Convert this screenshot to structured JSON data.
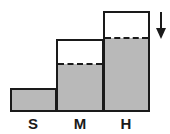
{
  "diagram": {
    "colors": {
      "fill": "#b9b9b9",
      "stroke": "#1a1a1a",
      "background": "#ffffff"
    },
    "bars": [
      {
        "label": "S",
        "fill_level": "full"
      },
      {
        "label": "M",
        "fill_level": "partial"
      },
      {
        "label": "H",
        "fill_level": "partial"
      }
    ],
    "arrow": {
      "direction": "down",
      "icon": "arrow-down-icon"
    }
  }
}
